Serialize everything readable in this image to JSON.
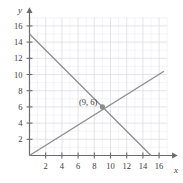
{
  "chart_data": {
    "type": "line",
    "title": "",
    "xlabel": "x",
    "ylabel": "y",
    "xlim": [
      0,
      17.2
    ],
    "ylim": [
      0,
      17.2
    ],
    "grid": true,
    "grid_minor_step": 1,
    "grid_major_step": 2,
    "legend": "none",
    "xticks": [
      2,
      4,
      6,
      8,
      10,
      12,
      14,
      16
    ],
    "yticks": [
      2,
      4,
      6,
      8,
      10,
      12,
      14,
      16
    ],
    "xtick_labels": [
      "2",
      "4",
      "6",
      "8",
      "10",
      "12",
      "14",
      "16"
    ],
    "ytick_labels": [
      "2",
      "4",
      "6",
      "8",
      "10",
      "12",
      "14",
      "16"
    ],
    "series": [
      {
        "name": "descending-line",
        "points": [
          [
            0,
            15
          ],
          [
            15,
            0
          ]
        ],
        "color": "#8c8c8c"
      },
      {
        "name": "ascending-line",
        "points": [
          [
            0,
            0
          ],
          [
            16.6,
            10.4
          ]
        ],
        "color": "#8c8c8c"
      }
    ],
    "annotations": [
      {
        "name": "intersection-point",
        "x": 9,
        "y": 6,
        "label": "(9, 6)",
        "marker": "dot",
        "color": "#8c8c8c"
      }
    ]
  },
  "colors": {
    "line": "#8c8c8c",
    "axis": "#6b6b6b",
    "grid_minor": "#e8e8ee",
    "grid_major": "#d9d9e2",
    "text": "#3b3b3b",
    "background": "#ffffff"
  },
  "axes": {
    "y_axis_name": "y",
    "x_axis_name": "x"
  }
}
